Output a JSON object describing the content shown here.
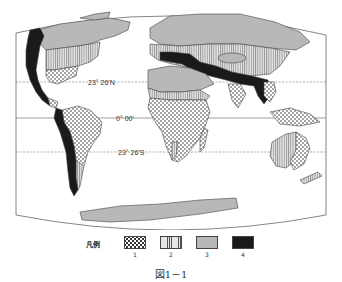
{
  "figure": {
    "caption": "図1－1",
    "legend_title": "凡例",
    "legend": [
      {
        "id": "1",
        "label": "1",
        "pattern": "dotted"
      },
      {
        "id": "2",
        "label": "2",
        "pattern": "vertical-lines"
      },
      {
        "id": "3",
        "label": "3",
        "pattern": "gray"
      },
      {
        "id": "4",
        "label": "4",
        "pattern": "black"
      }
    ],
    "latitude_lines": [
      {
        "label": "23° 26′N"
      },
      {
        "label": "0° 00′"
      },
      {
        "label": "23° 26′S"
      }
    ]
  },
  "colors": {
    "gray": "#b8b8b8",
    "black": "#1a1a1a",
    "outline": "#444444",
    "background": "#ffffff"
  }
}
